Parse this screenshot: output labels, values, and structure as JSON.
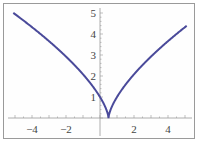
{
  "chart_data": {
    "type": "line",
    "title": "",
    "xlabel": "",
    "ylabel": "",
    "function": "y = |2x - 1|^(2/3)",
    "xlim": [
      -5.2,
      5.2
    ],
    "ylim": [
      0,
      5.2
    ],
    "grid": false,
    "legend": null,
    "x_ticks": [
      -4,
      -2,
      2,
      4
    ],
    "y_ticks": [
      1,
      2,
      3,
      4,
      5
    ],
    "x_tick_labels": [
      "−4",
      "−2",
      "2",
      "4"
    ],
    "y_tick_labels": [
      "1",
      "2",
      "3",
      "4",
      "5"
    ],
    "series": [
      {
        "name": "curve",
        "color": "#4a4a9a",
        "x": [
          -5,
          -4,
          -3,
          -2,
          -1,
          0,
          0.25,
          0.5,
          0.75,
          1,
          2,
          3,
          4,
          5
        ],
        "y": [
          4.95,
          4.33,
          3.66,
          2.92,
          2.08,
          1.0,
          0.63,
          0.0,
          0.63,
          1.0,
          2.08,
          2.92,
          3.66,
          4.33
        ]
      }
    ]
  }
}
